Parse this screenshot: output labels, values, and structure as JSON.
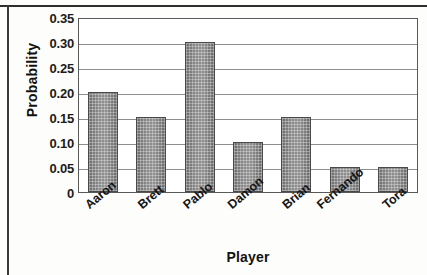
{
  "chart_data": {
    "type": "bar",
    "title": "",
    "subtitle": "",
    "xlabel": "Player",
    "ylabel": "Probability",
    "categories": [
      "Aaron",
      "Brett",
      "Pablo",
      "Damon",
      "Brian",
      "Fernando",
      "Tora"
    ],
    "values": [
      0.2,
      0.15,
      0.3,
      0.1,
      0.15,
      0.05,
      0.05
    ],
    "ylim": [
      0,
      0.35
    ],
    "yticks": [
      "0",
      "0.05",
      "0.10",
      "0.15",
      "0.20",
      "0.25",
      "0.30",
      "0.35"
    ],
    "ytick_values": [
      0,
      0.05,
      0.1,
      0.15,
      0.2,
      0.25,
      0.3,
      0.35
    ],
    "grid": "horizontal",
    "legend": "none",
    "bar_color": "#7c7c7c",
    "grid_color": "#8d8d8d",
    "axis_color": "#595959",
    "text_color": "#121212"
  }
}
